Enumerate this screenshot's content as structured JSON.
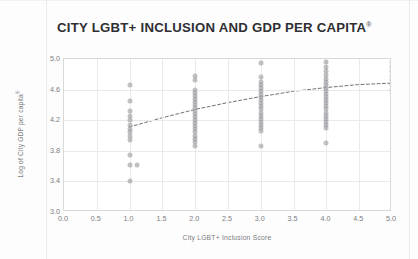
{
  "chart_title": "CITY LGBT+ INCLUSION AND GDP PER CAPITA",
  "chart_title_superscript": "®",
  "colors": {
    "point": "#9b9b9f",
    "grid": "#eaeaea",
    "axis_border": "#d9d9d9",
    "title": "#2f2f33",
    "tick_text": "#7c7c80",
    "trend_line": "#6f6f73",
    "background": "#fdfdfd"
  },
  "chart_data": {
    "type": "scatter",
    "title": "CITY LGBT+ INCLUSION AND GDP PER CAPITA®",
    "xlabel": "City LGBT+ Inclusion Score",
    "ylabel": "Log of City GDP per capita",
    "ylabel_superscript": "®",
    "xlim": [
      0.0,
      5.0
    ],
    "ylim": [
      3.0,
      5.0
    ],
    "xticks": [
      "0.0",
      "0.5",
      "1.0",
      "1.5",
      "2.0",
      "2.5",
      "3.0",
      "3.5",
      "4.0",
      "4.5",
      "5.0"
    ],
    "xtick_values": [
      0.0,
      0.5,
      1.0,
      1.5,
      2.0,
      2.5,
      3.0,
      3.5,
      4.0,
      4.5,
      5.0
    ],
    "yticks": [
      "3.0",
      "3.4",
      "3.8",
      "4.2",
      "4.6",
      "5.0"
    ],
    "ytick_values": [
      3.0,
      3.4,
      3.8,
      4.2,
      4.6,
      5.0
    ],
    "grid": true,
    "legend": null,
    "points": [
      {
        "x": 1.0,
        "y": 4.66
      },
      {
        "x": 1.0,
        "y": 4.45
      },
      {
        "x": 1.0,
        "y": 4.32
      },
      {
        "x": 1.0,
        "y": 4.26
      },
      {
        "x": 1.0,
        "y": 4.2
      },
      {
        "x": 1.0,
        "y": 4.14
      },
      {
        "x": 1.0,
        "y": 4.09
      },
      {
        "x": 1.0,
        "y": 4.04
      },
      {
        "x": 1.0,
        "y": 3.99
      },
      {
        "x": 1.0,
        "y": 3.94
      },
      {
        "x": 1.0,
        "y": 3.75
      },
      {
        "x": 1.0,
        "y": 3.62
      },
      {
        "x": 1.0,
        "y": 3.4
      },
      {
        "x": 1.12,
        "y": 3.61
      },
      {
        "x": 2.0,
        "y": 4.78
      },
      {
        "x": 2.0,
        "y": 4.72
      },
      {
        "x": 2.0,
        "y": 4.6
      },
      {
        "x": 2.0,
        "y": 4.56
      },
      {
        "x": 2.0,
        "y": 4.52
      },
      {
        "x": 2.0,
        "y": 4.48
      },
      {
        "x": 2.0,
        "y": 4.44
      },
      {
        "x": 2.0,
        "y": 4.4
      },
      {
        "x": 2.0,
        "y": 4.36
      },
      {
        "x": 2.0,
        "y": 4.32
      },
      {
        "x": 2.0,
        "y": 4.28
      },
      {
        "x": 2.0,
        "y": 4.24
      },
      {
        "x": 2.0,
        "y": 4.2
      },
      {
        "x": 2.0,
        "y": 4.16
      },
      {
        "x": 2.0,
        "y": 4.12
      },
      {
        "x": 2.0,
        "y": 4.08
      },
      {
        "x": 2.0,
        "y": 4.04
      },
      {
        "x": 2.0,
        "y": 4.0
      },
      {
        "x": 2.0,
        "y": 3.96
      },
      {
        "x": 2.0,
        "y": 3.92
      },
      {
        "x": 2.0,
        "y": 3.86
      },
      {
        "x": 3.0,
        "y": 4.95
      },
      {
        "x": 3.0,
        "y": 4.76
      },
      {
        "x": 3.0,
        "y": 4.7
      },
      {
        "x": 3.0,
        "y": 4.66
      },
      {
        "x": 3.0,
        "y": 4.62
      },
      {
        "x": 3.0,
        "y": 4.58
      },
      {
        "x": 3.0,
        "y": 4.54
      },
      {
        "x": 3.0,
        "y": 4.5
      },
      {
        "x": 3.0,
        "y": 4.46
      },
      {
        "x": 3.0,
        "y": 4.42
      },
      {
        "x": 3.0,
        "y": 4.38
      },
      {
        "x": 3.0,
        "y": 4.34
      },
      {
        "x": 3.0,
        "y": 4.3
      },
      {
        "x": 3.0,
        "y": 4.26
      },
      {
        "x": 3.0,
        "y": 4.22
      },
      {
        "x": 3.0,
        "y": 4.18
      },
      {
        "x": 3.0,
        "y": 4.14
      },
      {
        "x": 3.0,
        "y": 4.1
      },
      {
        "x": 3.0,
        "y": 4.06
      },
      {
        "x": 3.0,
        "y": 3.86
      },
      {
        "x": 4.0,
        "y": 4.96
      },
      {
        "x": 4.0,
        "y": 4.9
      },
      {
        "x": 4.0,
        "y": 4.84
      },
      {
        "x": 4.0,
        "y": 4.79
      },
      {
        "x": 4.0,
        "y": 4.74
      },
      {
        "x": 4.0,
        "y": 4.7
      },
      {
        "x": 4.0,
        "y": 4.66
      },
      {
        "x": 4.0,
        "y": 4.62
      },
      {
        "x": 4.0,
        "y": 4.58
      },
      {
        "x": 4.0,
        "y": 4.54
      },
      {
        "x": 4.0,
        "y": 4.5
      },
      {
        "x": 4.0,
        "y": 4.46
      },
      {
        "x": 4.0,
        "y": 4.42
      },
      {
        "x": 4.0,
        "y": 4.38
      },
      {
        "x": 4.0,
        "y": 4.34
      },
      {
        "x": 4.0,
        "y": 4.3
      },
      {
        "x": 4.0,
        "y": 4.26
      },
      {
        "x": 4.0,
        "y": 4.22
      },
      {
        "x": 4.0,
        "y": 4.18
      },
      {
        "x": 4.0,
        "y": 4.14
      },
      {
        "x": 4.0,
        "y": 4.1
      },
      {
        "x": 4.0,
        "y": 3.9
      },
      {
        "x": 5.0,
        "y": 4.96
      },
      {
        "x": 5.0,
        "y": 4.9
      },
      {
        "x": 5.0,
        "y": 4.84
      },
      {
        "x": 5.0,
        "y": 4.78
      },
      {
        "x": 5.0,
        "y": 4.72
      },
      {
        "x": 5.0,
        "y": 4.66
      },
      {
        "x": 5.0,
        "y": 4.6
      }
    ],
    "trend_line": {
      "style": "dashed",
      "points": [
        {
          "x": 1.0,
          "y": 4.1
        },
        {
          "x": 1.5,
          "y": 4.22
        },
        {
          "x": 2.0,
          "y": 4.33
        },
        {
          "x": 2.5,
          "y": 4.42
        },
        {
          "x": 3.0,
          "y": 4.5
        },
        {
          "x": 3.5,
          "y": 4.57
        },
        {
          "x": 4.0,
          "y": 4.62
        },
        {
          "x": 4.5,
          "y": 4.66
        },
        {
          "x": 5.0,
          "y": 4.68
        }
      ]
    }
  }
}
